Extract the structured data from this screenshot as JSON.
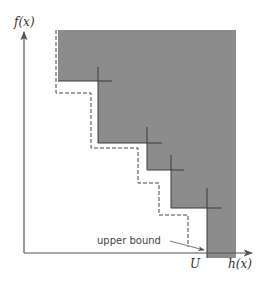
{
  "diagram": {
    "axes": {
      "y_label": "f(x)",
      "x_label": "h(x)"
    },
    "annotations": {
      "u_label": "U",
      "upper_bound_label": "upper bound"
    },
    "colors": {
      "shaded_region": "#8c8c8c",
      "axis": "#555555",
      "step_lines": "#333333",
      "dashed_line": "#444444"
    },
    "shaded_region": {
      "description": "Dominated region bounded by staircase of points",
      "points_px": [
        [
          98,
          81
        ],
        [
          147,
          143
        ],
        [
          171,
          170
        ],
        [
          207,
          208
        ]
      ]
    },
    "dashed_upper_bound_steps_px": [
      [
        56,
        30
      ],
      [
        56,
        93
      ],
      [
        91,
        93
      ],
      [
        91,
        148
      ],
      [
        138,
        148
      ],
      [
        138,
        183
      ],
      [
        159,
        183
      ],
      [
        159,
        215
      ],
      [
        188,
        215
      ],
      [
        188,
        247
      ]
    ]
  }
}
